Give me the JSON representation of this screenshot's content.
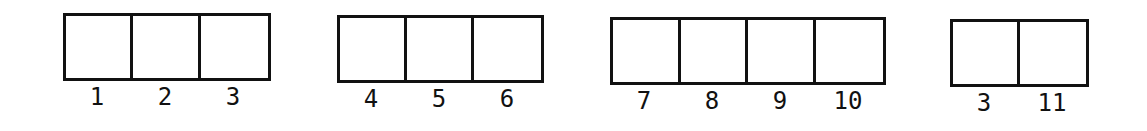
{
  "diagram": {
    "type": "array-partition",
    "stroke_color": "#111111",
    "background": "#ffffff",
    "groups": [
      {
        "cells": [
          {
            "label": "1"
          },
          {
            "label": "2"
          },
          {
            "label": "3"
          }
        ]
      },
      {
        "cells": [
          {
            "label": "4"
          },
          {
            "label": "5"
          },
          {
            "label": "6"
          }
        ]
      },
      {
        "cells": [
          {
            "label": "7"
          },
          {
            "label": "8"
          },
          {
            "label": "9"
          },
          {
            "label": "10"
          }
        ]
      },
      {
        "cells": [
          {
            "label": "3"
          },
          {
            "label": "11"
          }
        ]
      }
    ]
  }
}
